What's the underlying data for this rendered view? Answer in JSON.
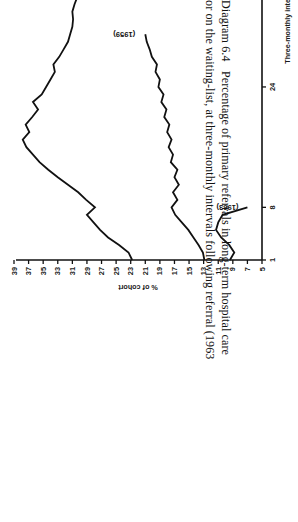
{
  "figure": {
    "caption_line_1": "Diagram 6.4   Percentage of primary referrals in long-term hospital care",
    "caption_line_2": "or on the waiting-list, at three-monthly intervals following referral (1963"
  },
  "chart_data": {
    "type": "line",
    "title": "",
    "xlabel": "Three-monthly intervals",
    "ylabel": "% of cohort",
    "xlim": [
      1,
      64
    ],
    "ylim": [
      5,
      39
    ],
    "grid": false,
    "legend": "inline-labels",
    "xticks": [
      1,
      8,
      24,
      64
    ],
    "xticklabels": [
      "1",
      "8",
      "24",
      "64"
    ],
    "yticks": [
      5,
      7,
      9,
      11,
      13,
      15,
      17,
      19,
      21,
      23,
      25,
      27,
      29,
      31,
      33,
      35,
      37,
      39
    ],
    "yticklabels": [
      "5",
      "7",
      "9",
      "11",
      "13",
      "15",
      "17",
      "19",
      "21",
      "23",
      "25",
      "27",
      "29",
      "31",
      "33",
      "35",
      "37",
      "39"
    ],
    "series": [
      {
        "name": "(1949)",
        "label": "(1949)",
        "color": "#111111",
        "x": [
          1,
          2,
          3,
          4,
          5,
          6,
          7,
          8,
          9,
          10,
          11,
          12,
          13,
          14,
          15,
          16,
          17,
          18,
          19,
          20,
          21,
          22,
          23,
          24,
          25,
          26,
          27,
          28,
          29,
          30,
          31,
          32,
          33,
          34,
          35,
          36,
          37,
          38,
          39,
          40,
          41,
          42,
          43,
          44,
          45,
          46,
          47,
          48,
          49,
          50,
          51,
          52,
          53,
          54,
          55,
          56,
          57,
          58,
          59,
          60,
          61,
          62,
          63,
          64
        ],
        "values": [
          22.8,
          23.3,
          24.6,
          26.1,
          27.2,
          28.1,
          29.0,
          27.9,
          29.1,
          30.2,
          31.6,
          33.0,
          34.3,
          35.5,
          36.4,
          37.3,
          37.8,
          36.9,
          37.4,
          36.5,
          35.7,
          36.4,
          35.2,
          34.6,
          34.0,
          33.4,
          33.6,
          32.8,
          32.2,
          31.6,
          31.3,
          31.0,
          30.9,
          31.0,
          30.7,
          30.3,
          30.2,
          30.4,
          30.0,
          29.6,
          29.5,
          29.3,
          29.2,
          29.5,
          29.1,
          29.0,
          28.9,
          29.2,
          28.8,
          28.6,
          28.9,
          28.5,
          28.3,
          28.6,
          28.2,
          28.0,
          27.8,
          28.1,
          27.6,
          27.4,
          27.7,
          27.3,
          27.1,
          27.3
        ]
      },
      {
        "name": "(1959)",
        "label": "(1959)",
        "color": "#111111",
        "x": [
          1,
          2,
          3,
          4,
          5,
          6,
          7,
          8,
          9,
          10,
          11,
          12,
          13,
          14,
          15,
          16,
          17,
          18,
          19,
          20,
          21,
          22,
          23,
          24,
          25,
          26,
          27,
          28,
          29,
          30,
          31
        ],
        "values": [
          12.9,
          13.1,
          13.7,
          14.4,
          15.1,
          16.0,
          16.9,
          17.4,
          16.6,
          17.2,
          16.4,
          17.0,
          16.6,
          17.5,
          17.2,
          17.8,
          17.4,
          18.0,
          17.7,
          18.4,
          18.1,
          18.8,
          18.5,
          19.2,
          19.0,
          19.6,
          19.4,
          20.1,
          20.4,
          20.8,
          21.0
        ]
      },
      {
        "name": "(1963)",
        "label": "(1963)",
        "color": "#111111",
        "x": [
          1,
          2,
          3,
          4,
          5,
          6,
          7,
          8
        ],
        "values": [
          9.4,
          8.8,
          9.5,
          10.6,
          11.3,
          11.0,
          10.4,
          7.0
        ]
      }
    ]
  },
  "axis": {
    "x_title": "Three-monthly intervals",
    "y_title": "% of cohort"
  }
}
